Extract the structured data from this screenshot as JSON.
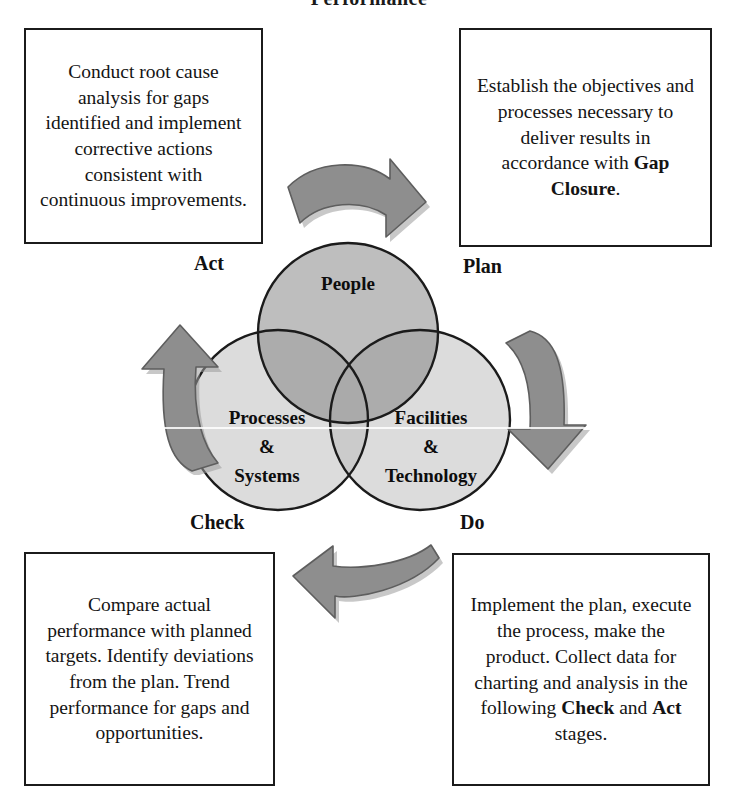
{
  "title": "Performance",
  "stages": {
    "plan_label": "Plan",
    "do_label": "Do",
    "check_label": "Check",
    "act_label": "Act"
  },
  "boxes": {
    "plan": {
      "name": "Plan",
      "text_plain": "Establish the objectives and processes necessary to deliver results in accordance with Gap Closure.",
      "text_before_bold": "Establish the objectives and processes necessary to deliver results in accordance with ",
      "bold_term": "Gap Closure",
      "text_after_bold": "."
    },
    "do": {
      "name": "Do",
      "text_plain": "Implement the plan, execute the process, make the product. Collect data for charting and analysis in the following Check and Act stages.",
      "segment_1": "Implement the plan, execute the process, make the product. Collect data for charting and analysis in the following ",
      "bold_term_1": "Check",
      "segment_2": " and ",
      "bold_term_2": "Act",
      "segment_3": " stages."
    },
    "check": {
      "name": "Check",
      "text_plain": "Compare actual performance with planned targets. Identify deviations from the plan. Trend performance for gaps and opportunities."
    },
    "act": {
      "name": "Act",
      "text_plain": "Conduct root cause analysis for gaps identified and implement corrective actions consistent with continuous improvements."
    }
  },
  "venn": {
    "circles": [
      {
        "id": "people",
        "label": "People",
        "label_lines": [
          "People"
        ],
        "fill": "#b9b9b9"
      },
      {
        "id": "processes",
        "label": "Processes & Systems",
        "label_lines": [
          "Processes",
          "&",
          "Systems"
        ],
        "fill": "#dcdcdc"
      },
      {
        "id": "facilities",
        "label": "Facilities & Technology",
        "label_lines": [
          "Facilities",
          "&",
          "Technology"
        ],
        "fill": "#dcdcdc"
      }
    ],
    "stroke": "#1b1b1b"
  },
  "arrows": {
    "plan_arrow": "arrow-curved-right-down",
    "do_arrow": "arrow-curved-down",
    "check_arrow": "arrow-curved-left",
    "act_arrow": "arrow-curved-up",
    "fill": "#8e8e8e",
    "stroke": "#5f5f5f"
  },
  "colors": {
    "page_background": "#ffffff",
    "text": "#111111",
    "box_border": "#1b1b1b",
    "circle_dark": "#b9b9b9",
    "circle_light": "#dcdcdc",
    "arrow_gray": "#8e8e8e"
  }
}
